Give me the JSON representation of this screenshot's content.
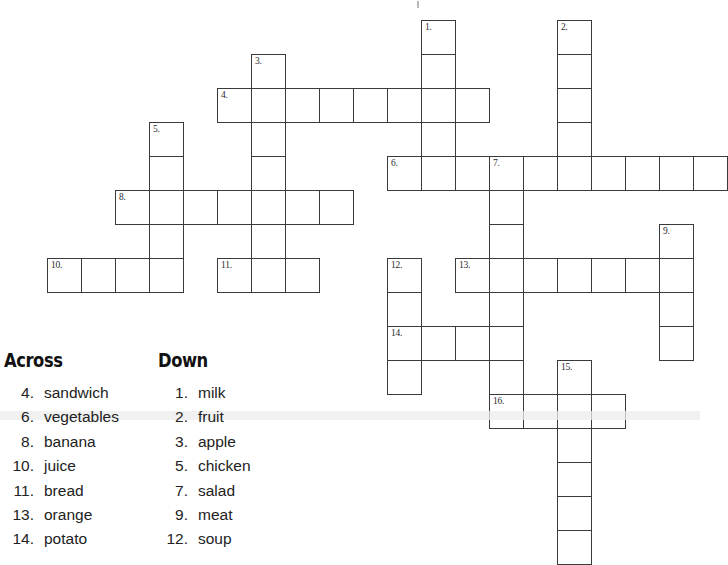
{
  "worksheet": {
    "type": "crossword-puzzle",
    "theme": "food"
  },
  "grid": {
    "cell_size_px": 35,
    "origin": {
      "x": 13,
      "y": 20
    },
    "border_color": "#3a3a3a",
    "cell_fill": "#ffffff",
    "entries": [
      {
        "number": "1.",
        "direction": "down",
        "answer": "milk",
        "length": 4,
        "col": 12,
        "row": 0
      },
      {
        "number": "2.",
        "direction": "down",
        "answer": "fruit",
        "length": 5,
        "col": 16,
        "row": 0
      },
      {
        "number": "3.",
        "direction": "down",
        "answer": "apple",
        "length": 7,
        "col": 7,
        "row": 1
      },
      {
        "number": "4.",
        "direction": "across",
        "answer": "sandwich",
        "length": 8,
        "col": 6,
        "row": 2
      },
      {
        "number": "5.",
        "direction": "down",
        "answer": "chicken",
        "length": 5,
        "col": 4,
        "row": 3
      },
      {
        "number": "6.",
        "direction": "across",
        "answer": "vegetables",
        "length": 10,
        "col": 11,
        "row": 4
      },
      {
        "number": "7.",
        "direction": "down",
        "answer": "salad",
        "length": 8,
        "col": 14,
        "row": 4
      },
      {
        "number": "8.",
        "direction": "across",
        "answer": "banana",
        "length": 7,
        "col": 3,
        "row": 5
      },
      {
        "number": "9.",
        "direction": "down",
        "answer": "meat",
        "length": 4,
        "col": 19,
        "row": 6
      },
      {
        "number": "10.",
        "direction": "across",
        "answer": "juice",
        "length": 4,
        "col": 1,
        "row": 7
      },
      {
        "number": "11.",
        "direction": "across",
        "answer": "bread",
        "length": 3,
        "col": 6,
        "row": 7
      },
      {
        "number": "12.",
        "direction": "down",
        "answer": "soup",
        "length": 4,
        "col": 11,
        "row": 7
      },
      {
        "number": "13.",
        "direction": "across",
        "answer": "orange",
        "length": 7,
        "col": 13,
        "row": 7
      },
      {
        "number": "14.",
        "direction": "across",
        "answer": "potato",
        "length": 4,
        "col": 11,
        "row": 9
      },
      {
        "number": "15.",
        "direction": "down",
        "answer": "",
        "length": 6,
        "col": 16,
        "row": 10
      },
      {
        "number": "16.",
        "direction": "across",
        "answer": "",
        "length": 4,
        "col": 14,
        "row": 11
      }
    ]
  },
  "clues": {
    "across": {
      "heading": "Across",
      "items": [
        {
          "number": "4.",
          "word": "sandwich"
        },
        {
          "number": "6.",
          "word": "vegetables"
        },
        {
          "number": "8.",
          "word": "banana"
        },
        {
          "number": "10.",
          "word": "juice"
        },
        {
          "number": "11.",
          "word": "bread"
        },
        {
          "number": "13.",
          "word": "orange"
        },
        {
          "number": "14.",
          "word": "potato"
        }
      ]
    },
    "down": {
      "heading": "Down",
      "items": [
        {
          "number": "1.",
          "word": "milk"
        },
        {
          "number": "2.",
          "word": "fruit"
        },
        {
          "number": "3.",
          "word": "apple"
        },
        {
          "number": "5.",
          "word": "chicken"
        },
        {
          "number": "7.",
          "word": "salad"
        },
        {
          "number": "9.",
          "word": "meat"
        },
        {
          "number": "12.",
          "word": "soup"
        }
      ]
    }
  }
}
